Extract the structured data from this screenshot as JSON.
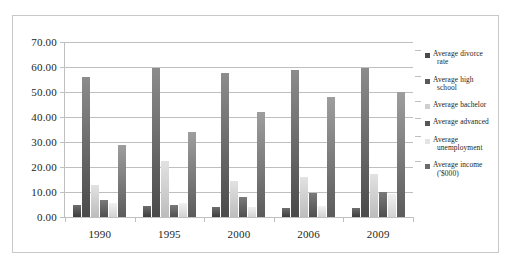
{
  "chart_data": {
    "type": "bar",
    "title": "",
    "xlabel": "",
    "ylabel": "",
    "ylim": [
      0,
      70
    ],
    "ytick_step": 10,
    "grid": true,
    "legend_position": "right",
    "categories": [
      "1990",
      "1995",
      "2000",
      "2006",
      "2009"
    ],
    "ytick_labels": [
      "70.00",
      "60.00",
      "50.00",
      "40.00",
      "30.00",
      "20.00",
      "10.00",
      "0.00"
    ],
    "ytick_values": [
      70,
      60,
      50,
      40,
      30,
      20,
      10,
      0
    ],
    "series": [
      {
        "name": "Average divorce rate",
        "color": "#4a4a4a",
        "values": [
          4.7,
          4.4,
          4.1,
          3.6,
          3.5
        ]
      },
      {
        "name": "Average high school",
        "color": "#595959",
        "values": [
          55.9,
          59.7,
          57.6,
          58.7,
          59.5
        ]
      },
      {
        "name": "Average bachelor",
        "color": "#cfcfcf",
        "values": [
          12.8,
          22.4,
          14.6,
          16.2,
          17.2
        ]
      },
      {
        "name": "Average advanced",
        "color": "#565656",
        "values": [
          6.9,
          4.8,
          8.1,
          9.5,
          10.1
        ]
      },
      {
        "name": "Average unemployment",
        "color": "#e4e4e4",
        "values": [
          5.6,
          5.6,
          4.0,
          4.6,
          9.3
        ]
      },
      {
        "name": "Average income ('$000)",
        "color": "#6b6b6b",
        "values": [
          29.0,
          34.1,
          41.9,
          48.2,
          50.2
        ]
      }
    ]
  },
  "legend": {
    "items": [
      {
        "label_line1": "Average divorce",
        "label_line2": "rate"
      },
      {
        "label_line1": "Average high",
        "label_line2": "school"
      },
      {
        "label_line1": "Average bachelor",
        "label_line2": ""
      },
      {
        "label_line1": "Average advanced",
        "label_line2": ""
      },
      {
        "label_line1": "Average",
        "label_line2": "unemployment"
      },
      {
        "label_line1": "Average income",
        "label_line2": "('$000)"
      }
    ]
  }
}
